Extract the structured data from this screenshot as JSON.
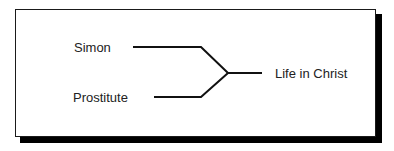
{
  "diagram": {
    "type": "converging-branch",
    "inputs": [
      {
        "label": "Simon"
      },
      {
        "label": "Prostitute"
      }
    ],
    "output": {
      "label": "Life in Christ"
    },
    "colors": {
      "line": "#111111",
      "text": "#222222",
      "shadow": "#000000",
      "background": "#ffffff"
    }
  }
}
